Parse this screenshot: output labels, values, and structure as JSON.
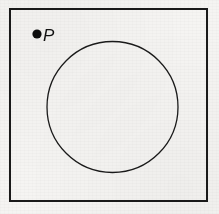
{
  "figure": {
    "canvas": {
      "width": 219,
      "height": 214
    },
    "background_color": "#f5f4f2",
    "ink_color": "#1a1a1a"
  },
  "frame": {
    "name": "bounding-rectangle",
    "x": 10,
    "y": 9,
    "width": 197,
    "height": 192,
    "stroke_color": "#1a1a1a",
    "stroke_width": 1.8,
    "fill": "none"
  },
  "circle": {
    "name": "circle",
    "center_x": 112.5,
    "center_y": 107,
    "radius": 65.5,
    "stroke_color": "#1a1a1a",
    "stroke_width": 1.3,
    "fill": "none"
  },
  "point": {
    "name": "point-P",
    "label": "P",
    "marker_x": 37,
    "marker_y": 34,
    "marker_radius": 4.6,
    "marker_color": "#0d0d0d",
    "label_x": 43,
    "label_y": 41,
    "label_color": "#111111",
    "position_description": "outside the circle, upper-left of the rectangle"
  }
}
